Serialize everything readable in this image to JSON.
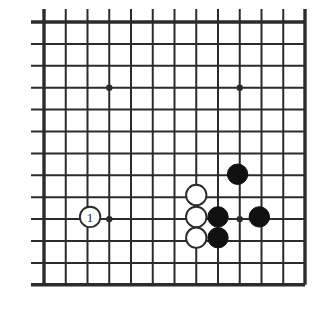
{
  "figure": {
    "kind": "go-board-diagram",
    "background_color": "#ffffff",
    "line_color": "#2b2b2b",
    "black_stone_color": "#111111",
    "white_stone_fill": "#ffffff",
    "white_stone_outline": "#2b2b2b"
  },
  "board": {
    "columns": 13,
    "rows": 13,
    "origin_x": 44,
    "origin_y": 22,
    "spacing_x": 21.75,
    "spacing_y": 21.9,
    "thin_line_width": 2,
    "thick_line_width": 3.4,
    "overhang": 13,
    "edges": {
      "top": "thick",
      "left": "thick",
      "bottom": "thick",
      "right": "thick"
    },
    "star_points": [
      {
        "col": 3,
        "row": 3
      },
      {
        "col": 9,
        "row": 3
      },
      {
        "col": 3,
        "row": 9
      },
      {
        "col": 9,
        "row": 9
      }
    ],
    "star_point_radius": 3.2
  },
  "stones": {
    "radius": 10.2,
    "items": [
      {
        "color": "white",
        "col": 2.12,
        "row": 8.9,
        "label": "1",
        "name": "white-stone-move-1"
      },
      {
        "color": "white",
        "col": 7.0,
        "row": 7.9,
        "label": "",
        "name": "white-stone"
      },
      {
        "color": "white",
        "col": 7.0,
        "row": 8.9,
        "label": "",
        "name": "white-stone"
      },
      {
        "color": "white",
        "col": 7.0,
        "row": 9.85,
        "label": "",
        "name": "white-stone"
      },
      {
        "color": "black",
        "col": 8.0,
        "row": 8.9,
        "label": "",
        "name": "black-stone"
      },
      {
        "color": "black",
        "col": 8.0,
        "row": 9.85,
        "label": "",
        "name": "black-stone"
      },
      {
        "color": "black",
        "col": 8.9,
        "row": 6.95,
        "label": "",
        "name": "black-stone"
      },
      {
        "color": "black",
        "col": 9.9,
        "row": 8.9,
        "label": "",
        "name": "black-stone"
      }
    ]
  },
  "move_labels": {
    "move_1": "1"
  }
}
